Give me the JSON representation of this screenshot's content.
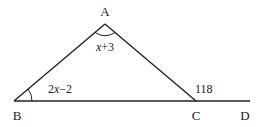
{
  "diagram": {
    "type": "triangle-exterior-angle",
    "points": {
      "A": {
        "label": "A",
        "x": 105,
        "y": 24
      },
      "B": {
        "label": "B",
        "x": 14,
        "y": 101
      },
      "C": {
        "label": "C",
        "x": 196,
        "y": 101
      },
      "D": {
        "label": "D",
        "x": 250,
        "y": 101
      }
    },
    "angles": {
      "A": {
        "label": "x+3",
        "var": "x",
        "op": "+3"
      },
      "B": {
        "label": "2x−2",
        "coef": "2",
        "var": "x",
        "op": "−2"
      },
      "C_exterior": {
        "label": "118"
      }
    },
    "colors": {
      "stroke": "#222222",
      "background": "#ffffff"
    }
  }
}
